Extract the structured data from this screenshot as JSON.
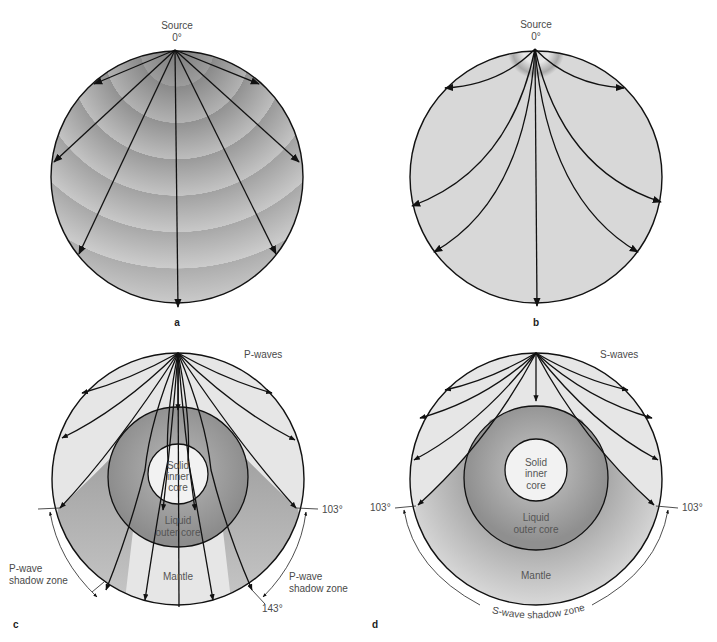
{
  "figure": {
    "panels": [
      {
        "id": "a",
        "letter": "a",
        "source_label": "Source",
        "source_angle": "0°",
        "description": "Straight ray paths in uniform-velocity Earth"
      },
      {
        "id": "b",
        "letter": "b",
        "source_label": "Source",
        "source_angle": "0°",
        "description": "Curved ray paths in Earth with velocity increasing with depth"
      },
      {
        "id": "c",
        "letter": "c",
        "wave_label": "P-waves",
        "inner_core_label": [
          "Solid",
          "inner",
          "core"
        ],
        "outer_core_label": [
          "Liquid",
          "outer core"
        ],
        "mantle_label": "Mantle",
        "angle_left": "",
        "angle_right_top": "103°",
        "angle_right_bottom": "143°",
        "shadow_left": [
          "P-wave",
          "shadow zone"
        ],
        "shadow_right": [
          "P-wave",
          "shadow zone"
        ]
      },
      {
        "id": "d",
        "letter": "d",
        "wave_label": "S-waves",
        "inner_core_label": [
          "Solid",
          "inner",
          "core"
        ],
        "outer_core_label": [
          "Liquid",
          "outer core"
        ],
        "mantle_label": "Mantle",
        "angle_left": "103°",
        "angle_right": "103°",
        "shadow_zone": "S-wave shadow zone"
      }
    ]
  },
  "colors": {
    "stroke": "#111111",
    "mantle_light": "#e6e6e6",
    "shadow_dark": "#a8a8a8",
    "outer_core": "#9a9a9a",
    "inner_core": "#f2f2f2",
    "text": "#4a4a4a"
  }
}
